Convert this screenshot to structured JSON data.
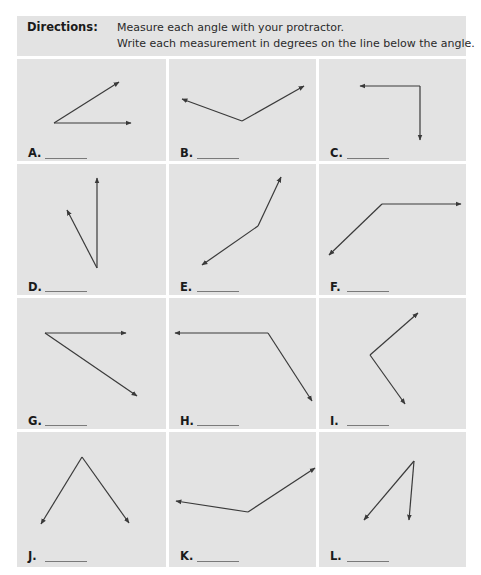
{
  "directions": {
    "label": "Directions:",
    "lines": [
      "Measure each angle with your protractor.",
      "Write each measurement in degrees on the line below the angle."
    ]
  },
  "colors": {
    "panel_bg": "#e3e3e3",
    "line": "#3a3a3a",
    "answer_line": "#7a7a7a"
  },
  "cells": [
    {
      "label": "A.",
      "answer": "",
      "vertex": [
        54,
        123
      ],
      "rays": [
        [
          119,
          82
        ],
        [
          131,
          123
        ]
      ]
    },
    {
      "label": "B.",
      "answer": "",
      "vertex": [
        242,
        121
      ],
      "rays": [
        [
          182,
          99
        ],
        [
          304,
          86
        ]
      ]
    },
    {
      "label": "C.",
      "answer": "",
      "vertex": [
        420,
        86
      ],
      "rays": [
        [
          360,
          86
        ],
        [
          420,
          140
        ]
      ]
    },
    {
      "label": "D.",
      "answer": "",
      "vertex": [
        97,
        268
      ],
      "rays": [
        [
          97,
          178
        ],
        [
          67,
          210
        ]
      ]
    },
    {
      "label": "E.",
      "answer": "",
      "vertex": [
        258,
        226
      ],
      "rays": [
        [
          281,
          177
        ],
        [
          202,
          265
        ]
      ]
    },
    {
      "label": "F.",
      "answer": "",
      "vertex": [
        382,
        204
      ],
      "rays": [
        [
          461,
          204
        ],
        [
          329,
          255
        ]
      ]
    },
    {
      "label": "G.",
      "answer": "",
      "vertex": [
        45,
        333
      ],
      "rays": [
        [
          126,
          333
        ],
        [
          137,
          396
        ]
      ]
    },
    {
      "label": "H.",
      "answer": "",
      "vertex": [
        268,
        333
      ],
      "rays": [
        [
          175,
          333
        ],
        [
          312,
          401
        ]
      ]
    },
    {
      "label": "I.",
      "answer": "",
      "vertex": [
        370,
        355
      ],
      "rays": [
        [
          418,
          313
        ],
        [
          405,
          404
        ]
      ]
    },
    {
      "label": "J.",
      "answer": "",
      "vertex": [
        82,
        457
      ],
      "rays": [
        [
          41,
          524
        ],
        [
          129,
          523
        ]
      ]
    },
    {
      "label": "K.",
      "answer": "",
      "vertex": [
        248,
        512
      ],
      "rays": [
        [
          176,
          501
        ],
        [
          315,
          468
        ]
      ]
    },
    {
      "label": "L.",
      "answer": "",
      "vertex": [
        414,
        461
      ],
      "rays": [
        [
          364,
          520
        ],
        [
          409,
          520
        ]
      ]
    }
  ]
}
